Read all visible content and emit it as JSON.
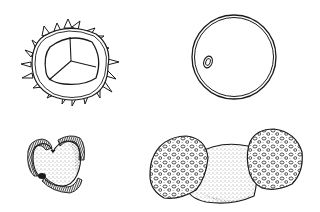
{
  "figure": {
    "type": "scientific-illustration",
    "panels": [
      {
        "id": "a",
        "description": "echinate trilete spore with spiny outer wall",
        "position": "top-left"
      },
      {
        "id": "b",
        "description": "spherical grain with single pore",
        "position": "top-right"
      },
      {
        "id": "c",
        "description": "triangular stippled grain with striate rim",
        "position": "bottom-left"
      },
      {
        "id": "d",
        "description": "bisaccate grain with reticulate air sacs",
        "position": "bottom-right"
      }
    ],
    "colors": {
      "ink": "#1a1a1a",
      "background": "#ffffff"
    }
  }
}
